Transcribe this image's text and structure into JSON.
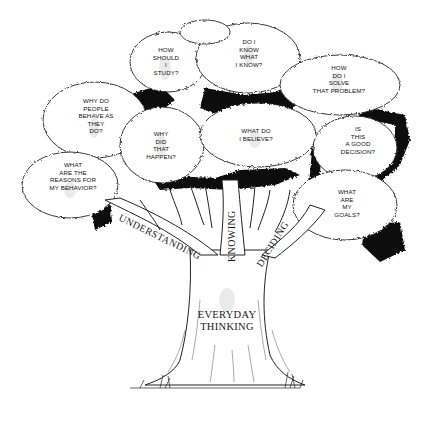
{
  "diagram": {
    "type": "concept-tree",
    "trunk": {
      "label": "EVERYDAY\nTHINKING"
    },
    "branches": [
      {
        "id": "understanding",
        "label": "UNDERSTANDING"
      },
      {
        "id": "knowing",
        "label": "KNOWING"
      },
      {
        "id": "deciding",
        "label": "DECIDING"
      }
    ],
    "questions": [
      {
        "id": "how-should-i-study",
        "text": "HOW\nSHOULD\nI\nSTUDY?"
      },
      {
        "id": "do-i-know-what-i-know",
        "text": "DO I\nKNOW\nWHAT\nI KNOW?"
      },
      {
        "id": "how-do-i-solve",
        "text": "HOW\nDO I\nSOLVE\nTHAT PROBLEM?"
      },
      {
        "id": "why-do-people-behave",
        "text": "WHY DO\nPEOPLE\nBEHAVE AS\nTHEY\nDO?"
      },
      {
        "id": "why-did-that-happen",
        "text": "WHY\nDID\nTHAT\nHAPPEN?"
      },
      {
        "id": "what-do-i-believe",
        "text": "WHAT DO\nI BELIEVE?"
      },
      {
        "id": "is-this-a-good-decision",
        "text": "IS\nTHIS\nA GOOD\nDECISION?"
      },
      {
        "id": "reasons-for-behavior",
        "text": "WHAT\nARE THE\nREASONS FOR\nMY BEHAVIOR?"
      },
      {
        "id": "what-are-my-goals",
        "text": "WHAT\nARE\nMY\nGOALS?"
      }
    ],
    "colors": {
      "ink": "#111111",
      "paper": "#ffffff",
      "shade": "#d9d9d9"
    }
  }
}
